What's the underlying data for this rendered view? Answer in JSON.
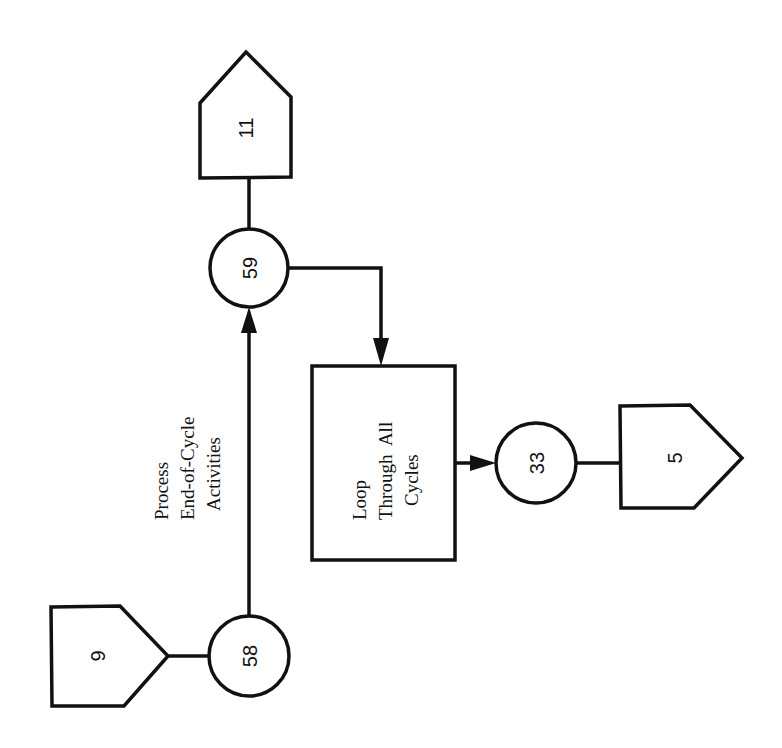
{
  "diagram": {
    "orientation": "rotated-90-ccw",
    "nodes": {
      "off_page_9": {
        "label": "9",
        "type": "off-page-connector"
      },
      "connector_58": {
        "label": "58",
        "type": "connector"
      },
      "connector_59": {
        "label": "59",
        "type": "connector"
      },
      "off_page_11": {
        "label": "11",
        "type": "off-page-connector"
      },
      "process_loop": {
        "type": "process",
        "lines": [
          "Loop",
          "Through  All",
          "Cycles"
        ]
      },
      "connector_33": {
        "label": "33",
        "type": "connector"
      },
      "off_page_5": {
        "label": "5",
        "type": "off-page-connector"
      }
    },
    "annotation": {
      "lines": [
        "Process",
        "End-of-Cycle",
        "Activities"
      ]
    },
    "edges": [
      {
        "from": "off_page_9",
        "to": "connector_58",
        "arrow": false
      },
      {
        "from": "connector_58",
        "to": "connector_59",
        "arrow": true
      },
      {
        "from": "connector_59",
        "to": "off_page_11",
        "arrow": false
      },
      {
        "from": "connector_59",
        "to": "process_loop",
        "arrow": true
      },
      {
        "from": "process_loop",
        "to": "connector_33",
        "arrow": true
      },
      {
        "from": "connector_33",
        "to": "off_page_5",
        "arrow": false
      }
    ]
  }
}
